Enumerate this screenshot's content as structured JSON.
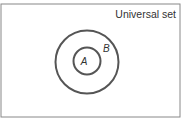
{
  "diagram": {
    "type": "venn-subset",
    "universal_label": "Universal set",
    "sets": [
      {
        "name": "A",
        "label": "A",
        "relation": "subset of B"
      },
      {
        "name": "B",
        "label": "B"
      }
    ],
    "colors": {
      "stroke": "#555555",
      "frame": "#888888",
      "text": "#333333"
    }
  }
}
